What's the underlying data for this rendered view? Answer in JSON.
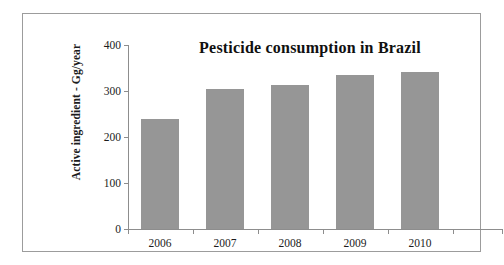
{
  "figure": {
    "border_color": "#9c9c9c",
    "background": "#ffffff"
  },
  "chart_data": {
    "type": "bar",
    "title": "Pesticide consumption in Brazil",
    "subtitle": "",
    "xlabel": "",
    "ylabel": "Active ingredient - Gg/year",
    "categories": [
      "2006",
      "2007",
      "2008",
      "2009",
      "2010"
    ],
    "values": [
      240,
      305,
      312,
      335,
      341
    ],
    "series": [
      {
        "name": "Active ingredient",
        "values": [
          240,
          305,
          312,
          335,
          341
        ]
      }
    ],
    "ylim": [
      0,
      400
    ],
    "ytick_labels": [
      "0",
      "100",
      "200",
      "300",
      "400"
    ],
    "ytick_values": [
      0,
      100,
      200,
      300,
      400
    ],
    "xtick_labels": [
      "2006",
      "2007",
      "2008",
      "2009",
      "2010"
    ],
    "grid": false,
    "legend": false,
    "legend_position": "none",
    "bar_color": "#969696",
    "axis_color": "#8d8d8d"
  }
}
